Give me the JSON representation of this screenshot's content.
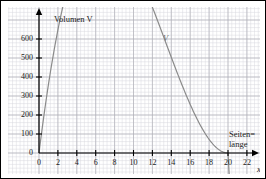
{
  "chart_data": {
    "type": "line",
    "title": "",
    "subtitle": "",
    "ylabel": "Volumen V",
    "xlabel": "Seiten=",
    "xlabel_line2": "länge",
    "xaxis_variable": "x",
    "curve_label": "V",
    "xlim": [
      0,
      23.5
    ],
    "ylim": [
      0,
      660
    ],
    "xticks": [
      0,
      2,
      4,
      6,
      8,
      10,
      12,
      14,
      16,
      18,
      20,
      22
    ],
    "yticks": [
      0,
      100,
      200,
      300,
      400,
      500,
      600
    ],
    "grid": true,
    "grid_minor_step_x": 0.4,
    "grid_minor_step_y": 20,
    "legend": "none",
    "roots": [
      0,
      20
    ],
    "peak": {
      "x": 13.33,
      "y": 592.6
    },
    "x": [
      0,
      0.5,
      1,
      1.5,
      2,
      2.5,
      3,
      3.5,
      4,
      4.5,
      5,
      5.5,
      6,
      6.5,
      7,
      7.5,
      8,
      8.5,
      9,
      9.5,
      10,
      10.5,
      11,
      11.5,
      12,
      12.5,
      13,
      13.33,
      13.5,
      14,
      14.5,
      15,
      15.5,
      16,
      16.5,
      17,
      17.5,
      18,
      18.5,
      19,
      19.5,
      20
    ],
    "y": [
      0,
      4.5,
      17.1,
      36.3,
      61.6,
      92.2,
      127.1,
      165.4,
      206.1,
      248.1,
      290.6,
      332.4,
      372.6,
      410.2,
      444.1,
      473.4,
      497.1,
      514.4,
      525.1,
      529.1,
      526.6,
      518.1,
      504.1,
      485.4,
      463.0,
      438.1,
      411.9,
      395.0,
      386.1,
      361.2,
      338.6,
      319.2,
      303.9,
      293.3,
      287.6,
      286.4,
      288.3,
      291.3,
      292.4,
      287.6,
      272.4,
      242.4
    ]
  },
  "chart_meta": {
    "y_axis_label": "Volumen V",
    "x_axis_label_part1": "Seiten=",
    "x_axis_label_part2": "länge",
    "x_axis_variable": "x",
    "curve_annotation": "V",
    "x_tick_labels": [
      "0",
      "2",
      "4",
      "6",
      "8",
      "10",
      "12",
      "14",
      "16",
      "18",
      "20",
      "22"
    ],
    "y_tick_labels": [
      "0",
      "100",
      "200",
      "300",
      "400",
      "500",
      "600"
    ],
    "colors": {
      "curve": "#8a8a8a",
      "axis": "#000000",
      "grid_minor": "#d8d8de",
      "grid_major": "#b0b0b8",
      "border": "#000000",
      "text": "#1a1a1a"
    }
  }
}
